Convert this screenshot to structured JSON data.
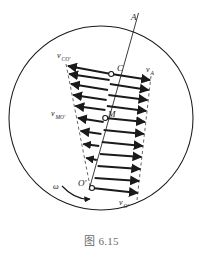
{
  "figure": {
    "caption": "图 6.15",
    "caption_number": "6.15",
    "diagram_type": "velocity-distribution-rolling-wheel",
    "colors": {
      "stroke": "#1a1a1a",
      "background": "#ffffff",
      "caption": "#6a6a6a",
      "dashed": "#555555"
    },
    "points": [
      {
        "id": "A",
        "label": "A",
        "x": 134,
        "y": 18,
        "marker": false
      },
      {
        "id": "C",
        "label": "C",
        "x": 111,
        "y": 74,
        "marker": true
      },
      {
        "id": "M",
        "label": "M",
        "x": 105,
        "y": 118,
        "marker": true
      },
      {
        "id": "Oprime",
        "label": "O′",
        "x": 92,
        "y": 183,
        "marker": true
      }
    ],
    "vector_labels": [
      {
        "id": "v_CO_prime",
        "base": "v",
        "sub": "CO′",
        "x": 57,
        "y": 58,
        "anchor": "start"
      },
      {
        "id": "v_A",
        "base": "v",
        "sub": "A",
        "x": 146,
        "y": 72,
        "anchor": "start"
      },
      {
        "id": "v_MO_prime",
        "base": "v",
        "sub": "MO′",
        "x": 51,
        "y": 116,
        "anchor": "start"
      },
      {
        "id": "v_O_prime",
        "base": "v",
        "sub": "O′",
        "x": 120,
        "y": 203,
        "anchor": "start"
      }
    ],
    "omega": {
      "id": "omega",
      "symbol": "ω",
      "x": 57,
      "y": 192,
      "description": "angular velocity curved arrow, clockwise at lower-left"
    },
    "circle": {
      "cx": 101,
      "cy": 118,
      "r": 92,
      "description": "wheel outline circle"
    },
    "axis_line": {
      "description": "straight line from O' through M and C up to A",
      "x1": 89,
      "y1": 190,
      "x2": 138,
      "y2": 14
    },
    "arrows_left": {
      "count": 8,
      "direction": "left",
      "description": "arrows from axis pointing left, lengths shrinking toward O'"
    },
    "arrows_right": {
      "count": 11,
      "direction": "right",
      "description": "arrows from axis pointing right, lengths growing from O' upward"
    },
    "envelopes": [
      {
        "id": "left-envelope",
        "style": "dashed",
        "description": "dashed line joining left arrow tips, converging at O'"
      },
      {
        "id": "right-envelope",
        "style": "dashed",
        "description": "dashed line joining right arrow tips, diverging from O'"
      }
    ]
  }
}
